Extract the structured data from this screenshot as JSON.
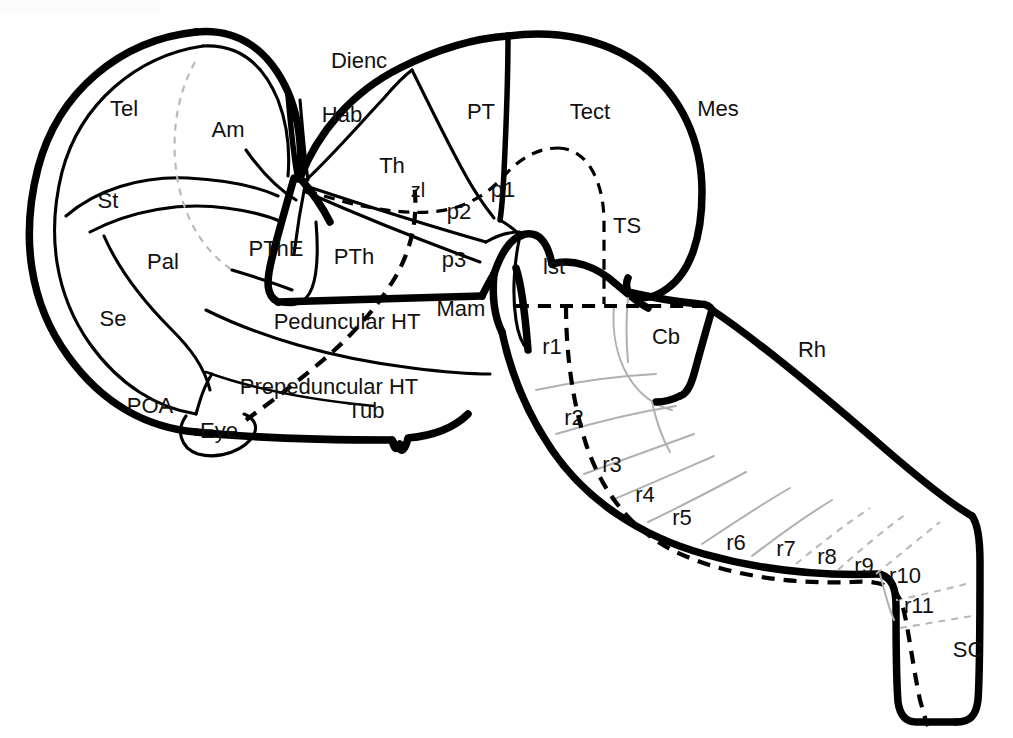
{
  "figure": {
    "kind": "schematic-diagram",
    "background_color": "#ffffff",
    "ink_color": "#000000",
    "faint_color": "#b8b8b8",
    "width": 1013,
    "height": 738,
    "corner_tint_color": "#fcfcfc"
  },
  "labels": [
    {
      "id": "tel",
      "text": "Tel",
      "x": 124,
      "y": 110,
      "size": "md"
    },
    {
      "id": "am",
      "text": "Am",
      "x": 228,
      "y": 131,
      "size": "md"
    },
    {
      "id": "st",
      "text": "St",
      "x": 108,
      "y": 202,
      "size": "md"
    },
    {
      "id": "pal",
      "text": "Pal",
      "x": 163,
      "y": 263,
      "size": "md"
    },
    {
      "id": "se",
      "text": "Se",
      "x": 113,
      "y": 320,
      "size": "md"
    },
    {
      "id": "poa",
      "text": "POA",
      "x": 150,
      "y": 407,
      "size": "md"
    },
    {
      "id": "eye",
      "text": "Eye",
      "x": 219,
      "y": 432,
      "size": "md"
    },
    {
      "id": "pthe",
      "text": "PThE",
      "x": 276,
      "y": 250,
      "size": "md"
    },
    {
      "id": "pth",
      "text": "PTh",
      "x": 354,
      "y": 258,
      "size": "md"
    },
    {
      "id": "dienc",
      "text": "Dienc",
      "x": 359,
      "y": 62,
      "size": "md"
    },
    {
      "id": "hab",
      "text": "Hab",
      "x": 342,
      "y": 116,
      "size": "md"
    },
    {
      "id": "th",
      "text": "Th",
      "x": 392,
      "y": 167,
      "size": "md"
    },
    {
      "id": "zl",
      "text": "zl",
      "x": 418,
      "y": 192,
      "size": "sm"
    },
    {
      "id": "p1",
      "text": "p1",
      "x": 503,
      "y": 191,
      "size": "md"
    },
    {
      "id": "p2",
      "text": "p2",
      "x": 459,
      "y": 213,
      "size": "md"
    },
    {
      "id": "p3",
      "text": "p3",
      "x": 454,
      "y": 261,
      "size": "md"
    },
    {
      "id": "pt",
      "text": "PT",
      "x": 481,
      "y": 113,
      "size": "md"
    },
    {
      "id": "tect",
      "text": "Tect",
      "x": 590,
      "y": 113,
      "size": "md"
    },
    {
      "id": "mes",
      "text": "Mes",
      "x": 718,
      "y": 110,
      "size": "md"
    },
    {
      "id": "ts",
      "text": "TS",
      "x": 627,
      "y": 227,
      "size": "md"
    },
    {
      "id": "mam",
      "text": "Mam",
      "x": 461,
      "y": 310,
      "size": "md"
    },
    {
      "id": "lst",
      "text": "lst",
      "x": 554,
      "y": 268,
      "size": "md"
    },
    {
      "id": "peduncular_ht",
      "text": "Peduncular HT",
      "x": 347,
      "y": 323,
      "size": "md"
    },
    {
      "id": "prepeduncular_ht",
      "text": "Prepeduncular HT",
      "x": 329,
      "y": 388,
      "size": "md"
    },
    {
      "id": "tub",
      "text": "Tub",
      "x": 366,
      "y": 412,
      "size": "md"
    },
    {
      "id": "cb",
      "text": "Cb",
      "x": 666,
      "y": 338,
      "size": "md"
    },
    {
      "id": "rh",
      "text": "Rh",
      "x": 812,
      "y": 351,
      "size": "md"
    },
    {
      "id": "r1",
      "text": "r1",
      "x": 552,
      "y": 348,
      "size": "md"
    },
    {
      "id": "r2",
      "text": "r2",
      "x": 574,
      "y": 419,
      "size": "md"
    },
    {
      "id": "r3",
      "text": "r3",
      "x": 612,
      "y": 466,
      "size": "md"
    },
    {
      "id": "r4",
      "text": "r4",
      "x": 645,
      "y": 496,
      "size": "md"
    },
    {
      "id": "r5",
      "text": "r5",
      "x": 682,
      "y": 519,
      "size": "md"
    },
    {
      "id": "r6",
      "text": "r6",
      "x": 736,
      "y": 544,
      "size": "md"
    },
    {
      "id": "r7",
      "text": "r7",
      "x": 786,
      "y": 550,
      "size": "md"
    },
    {
      "id": "r8",
      "text": "r8",
      "x": 827,
      "y": 558,
      "size": "md"
    },
    {
      "id": "r9",
      "text": "r9",
      "x": 864,
      "y": 567,
      "size": "md"
    },
    {
      "id": "r10",
      "text": "r10",
      "x": 905,
      "y": 577,
      "size": "md"
    },
    {
      "id": "r11",
      "text": "r11",
      "x": 919,
      "y": 607,
      "size": "md"
    },
    {
      "id": "sc",
      "text": "SC",
      "x": 968,
      "y": 651,
      "size": "md"
    }
  ],
  "legend": {
    "region_groups": [
      {
        "name": "Telencephalon",
        "abbrev": "Tel",
        "parts": [
          "Am",
          "St",
          "Pal",
          "Se",
          "POA"
        ]
      },
      {
        "name": "Diencephalon",
        "abbrev": "Dienc",
        "parts": [
          "Hab",
          "Th",
          "zl",
          "PT",
          "p1",
          "p2",
          "p3",
          "PTh",
          "PThE"
        ]
      },
      {
        "name": "Hypothalamus",
        "abbrev": "HT",
        "parts": [
          "Peduncular HT",
          "Prepeduncular HT",
          "Tub",
          "Mam"
        ]
      },
      {
        "name": "Mesencephalon",
        "abbrev": "Mes",
        "parts": [
          "Tect",
          "TS"
        ]
      },
      {
        "name": "Rhombencephalon",
        "abbrev": "Rh",
        "parts": [
          "lst",
          "Cb",
          "r1",
          "r2",
          "r3",
          "r4",
          "r5",
          "r6",
          "r7",
          "r8",
          "r9",
          "r10",
          "r11"
        ]
      },
      {
        "name": "Spinal cord",
        "abbrev": "SC",
        "parts": []
      }
    ]
  }
}
